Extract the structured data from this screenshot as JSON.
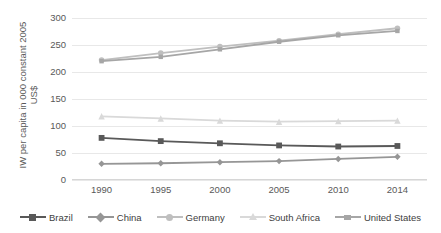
{
  "chart_data": {
    "type": "line",
    "title": "",
    "xlabel": "",
    "ylabel": "IW per capita in 000 constant 2005 US$",
    "ylabel_lines": [
      "IW per capita in 000 constant 2005",
      "US$"
    ],
    "categories": [
      "1990",
      "1995",
      "2000",
      "2005",
      "2010",
      "2014"
    ],
    "ylim": [
      0,
      300
    ],
    "yticks": [
      0,
      50,
      100,
      150,
      200,
      250,
      300
    ],
    "grid": true,
    "legend_position": "bottom",
    "series": [
      {
        "name": "Brazil",
        "values": [
          78,
          72,
          68,
          64,
          62,
          63
        ],
        "color": "#595959",
        "marker": "square"
      },
      {
        "name": "China",
        "values": [
          30,
          31,
          33,
          35,
          39,
          43
        ],
        "color": "#969696",
        "marker": "diamond"
      },
      {
        "name": "Germany",
        "values": [
          222,
          235,
          247,
          258,
          270,
          281
        ],
        "color": "#bfbfbf",
        "marker": "circle"
      },
      {
        "name": "South Africa",
        "values": [
          118,
          114,
          110,
          108,
          109,
          110
        ],
        "color": "#d9d9d9",
        "marker": "triangle"
      },
      {
        "name": "United States",
        "values": [
          220,
          228,
          242,
          256,
          268,
          276
        ],
        "color": "#a6a6a6",
        "marker": "dash"
      }
    ]
  }
}
